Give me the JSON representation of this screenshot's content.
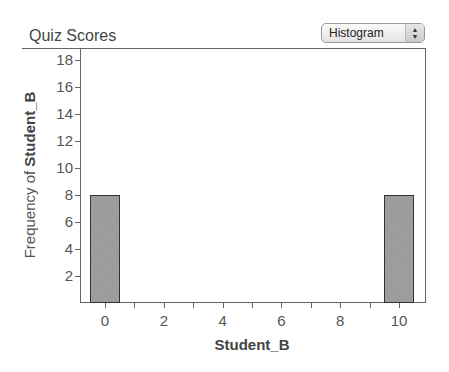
{
  "header": {
    "title": "Quiz Scores",
    "plot_type_selector": {
      "selected": "Histogram",
      "icon": "up-down-arrows-icon"
    }
  },
  "chart_data": {
    "type": "bar",
    "title": "Quiz Scores",
    "xlabel": "Student_B",
    "ylabel_prefix": "Frequency of ",
    "ylabel_variable": "Student_B",
    "ylim": [
      0,
      19
    ],
    "xlim": [
      -1,
      11
    ],
    "yticks": [
      2,
      4,
      6,
      8,
      10,
      12,
      14,
      16,
      18
    ],
    "xticks": [
      0,
      2,
      4,
      6,
      8,
      10
    ],
    "bins": [
      {
        "x_start": -0.5,
        "x_end": 0.5,
        "center": 0,
        "count": 8
      },
      {
        "x_start": 9.5,
        "x_end": 10.5,
        "center": 10,
        "count": 8
      }
    ],
    "categories": [
      "0",
      "10"
    ],
    "values": [
      8,
      8
    ],
    "bar_color": "#9a9a9a",
    "grid": false
  }
}
